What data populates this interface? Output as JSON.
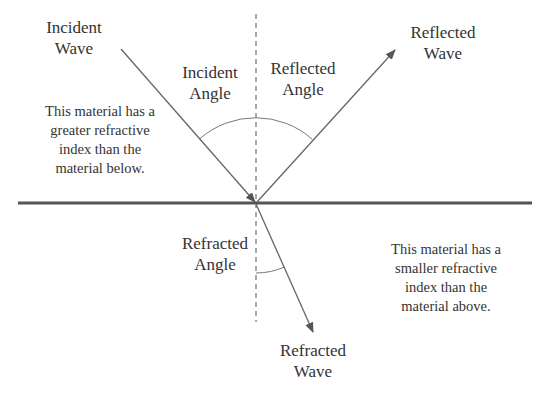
{
  "diagram": {
    "labels": {
      "incident_wave": "Incident\nWave",
      "incident_angle": "Incident\nAngle",
      "reflected_angle": "Reflected\nAngle",
      "reflected_wave": "Reflected\nWave",
      "refracted_angle": "Refracted\nAngle",
      "refracted_wave": "Refracted\nWave",
      "upper_material_note": "This material has a\ngreater refractive\nindex than the\nmaterial below.",
      "lower_material_note": "This material has a\nsmaller refractive\nindex than the\nmaterial above."
    },
    "elements": {
      "boundary": {
        "from": [
          18,
          203
        ],
        "to": [
          532,
          203
        ],
        "stroke": "#555555",
        "width": 3
      },
      "normal": {
        "from": [
          256,
          14
        ],
        "to": [
          256,
          322
        ],
        "stroke": "#555555",
        "dashed": true
      },
      "incident_ray": {
        "from": [
          121,
          49
        ],
        "to": [
          256,
          203
        ],
        "arrow": "end"
      },
      "reflected_ray": {
        "from": [
          256,
          203
        ],
        "to": [
          395,
          50
        ],
        "arrow": "end"
      },
      "refracted_ray": {
        "from": [
          256,
          203
        ],
        "to": [
          313,
          332
        ],
        "arrow": "end"
      },
      "incident_reflected_arc_radius": 85,
      "refracted_arc_radius": 70
    },
    "colors": {
      "line": "#666666",
      "boundary": "#555555",
      "text": "#333333",
      "background": "#ffffff"
    }
  }
}
